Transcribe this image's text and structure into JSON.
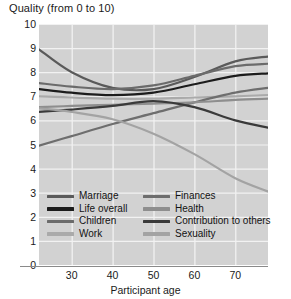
{
  "chart_data": {
    "type": "line",
    "title": "Quality (from 0 to 10)",
    "xlabel": "Participant age",
    "ylabel": "",
    "xlim": [
      22,
      78
    ],
    "ylim": [
      0,
      10
    ],
    "grid": true,
    "legend_position": "inside-bottom",
    "xticks": [
      30,
      40,
      50,
      60,
      70
    ],
    "yticks": [
      0,
      1,
      2,
      3,
      4,
      5,
      6,
      7,
      8,
      9,
      10
    ],
    "x": [
      22,
      30,
      40,
      50,
      60,
      70,
      78
    ],
    "series": [
      {
        "name": "Marriage",
        "color": "#5a5a5a",
        "values": [
          8.95,
          8.0,
          7.35,
          7.3,
          7.8,
          8.45,
          8.65
        ]
      },
      {
        "name": "Life overall",
        "color": "#1c1c1c",
        "values": [
          7.3,
          7.15,
          7.05,
          7.15,
          7.5,
          7.85,
          7.95
        ]
      },
      {
        "name": "Children",
        "color": "#6b6b6b",
        "values": [
          7.55,
          7.4,
          7.3,
          7.45,
          7.85,
          8.25,
          8.35
        ]
      },
      {
        "name": "Work",
        "color": "#aaaaaa",
        "values": [
          7.0,
          6.95,
          6.9,
          6.9,
          6.95,
          7.0,
          7.05
        ]
      },
      {
        "name": "Finances",
        "color": "#6e6e6e",
        "values": [
          4.95,
          5.35,
          5.85,
          6.3,
          6.75,
          7.15,
          7.35
        ]
      },
      {
        "name": "Health",
        "color": "#8e8e8e",
        "values": [
          6.55,
          6.6,
          6.65,
          6.7,
          6.75,
          6.85,
          6.9
        ]
      },
      {
        "name": "Contribution to others",
        "color": "#3a3a3a",
        "values": [
          6.35,
          6.45,
          6.6,
          6.8,
          6.55,
          6.0,
          5.7
        ]
      },
      {
        "name": "Sexuality",
        "color": "#a3a3a3",
        "values": [
          6.5,
          6.35,
          6.05,
          5.45,
          4.6,
          3.6,
          3.05
        ]
      }
    ]
  },
  "legend": {
    "columns": [
      [
        "Marriage",
        "Life overall",
        "Children",
        "Work"
      ],
      [
        "Finances",
        "Health",
        "Contribution to others",
        "Sexuality"
      ]
    ]
  },
  "colors": {
    "plot_background": "#d2d2d2",
    "gridline": "#f2f2f2",
    "axis": "#8a8a8a",
    "text": "#1a1a1a"
  }
}
